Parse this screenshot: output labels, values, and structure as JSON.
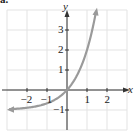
{
  "figure": {
    "panel_label": "a."
  },
  "chart_data": {
    "type": "line",
    "title": "",
    "xlabel": "x",
    "ylabel": "y",
    "xlim": [
      -3.3,
      3.0
    ],
    "ylim": [
      -2.0,
      4.5
    ],
    "grid": true,
    "x_ticks": [
      -2,
      -1,
      1,
      2
    ],
    "y_ticks": [
      -1,
      1,
      2,
      3
    ],
    "x_tick_labels": [
      "−2",
      "−1",
      "1",
      "2"
    ],
    "y_tick_labels": [
      "−1",
      "1",
      "2",
      "3"
    ],
    "series": [
      {
        "name": "y = 3^x − 1",
        "x": [
          -3.0,
          -2.5,
          -2.0,
          -1.5,
          -1.0,
          -0.5,
          0.0,
          0.5,
          1.0,
          1.25,
          1.45
        ],
        "values": [
          -0.96,
          -0.94,
          -0.89,
          -0.81,
          -0.67,
          -0.42,
          0.0,
          0.73,
          2.0,
          2.95,
          3.92
        ],
        "left_arrow": true,
        "right_arrow": true,
        "horizontal_asymptote": -1
      }
    ],
    "colors": {
      "curve": "#9a9a9a",
      "axis": "#333333",
      "grid": "#e3e3e3"
    }
  }
}
